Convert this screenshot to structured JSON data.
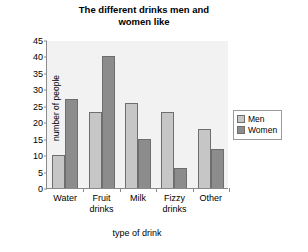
{
  "chart_data": {
    "type": "bar",
    "title_lines": [
      "The different drinks men and",
      "women like"
    ],
    "categories": [
      "Water",
      "Fruit drinks",
      "Milk",
      "Fizzy drinks",
      "Other"
    ],
    "category_lines": [
      [
        "Water"
      ],
      [
        "Fruit",
        "drinks"
      ],
      [
        "Milk"
      ],
      [
        "Fizzy",
        "drinks"
      ],
      [
        "Other"
      ]
    ],
    "series": [
      {
        "name": "Men",
        "values": [
          10,
          23,
          26,
          23,
          18
        ],
        "color": "#c6c6c6"
      },
      {
        "name": "Women",
        "values": [
          27,
          40,
          15,
          6,
          12
        ],
        "color": "#8c8c8c"
      }
    ],
    "xlabel": "type of drink",
    "ylabel": "number of people",
    "ylim": [
      0,
      45
    ],
    "ytick_step": 5,
    "yticks": [
      0,
      5,
      10,
      15,
      20,
      25,
      30,
      35,
      40,
      45
    ],
    "grid": false,
    "legend_position": "right",
    "plot_background": "#f2f2f2",
    "axis_color": "#8a8a8a"
  }
}
